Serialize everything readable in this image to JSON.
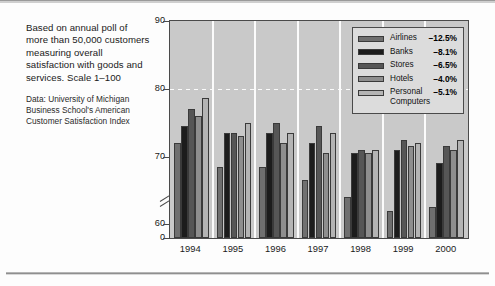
{
  "notes": {
    "lead": "Based on annual poll of more than 50,000 customers measuring overall satisfaction with goods and services. Scale 1–100",
    "source": "Data: University of Michigan Business School's American Customer Satisfaction Index"
  },
  "legend": {
    "entries": [
      {
        "label": "Airlines",
        "value": "–12.5%",
        "color": "#6f6f6f"
      },
      {
        "label": "Banks",
        "value": "–8.1%",
        "color": "#1c1c1c"
      },
      {
        "label": "Stores",
        "value": "–6.5%",
        "color": "#565656"
      },
      {
        "label": "Hotels",
        "value": "–4.0%",
        "color": "#8e8e8e"
      },
      {
        "label": "Personal Computers",
        "value": "–5.1%",
        "color": "#b4b4b4"
      }
    ]
  },
  "chart_data": {
    "type": "bar",
    "title": "",
    "xlabel": "",
    "ylabel": "",
    "ylim": [
      0,
      90
    ],
    "yticks": [
      0,
      60,
      70,
      80,
      90
    ],
    "ytick_labels": [
      "0",
      "60",
      "70",
      "80",
      "90"
    ],
    "axis_break": true,
    "axis_break_between": [
      0,
      60
    ],
    "grid": "dashed white horizontal line at 80; white vertical separators between year groups",
    "legend_position": "top-right inside plot",
    "categories": [
      "1994",
      "1995",
      "1996",
      "1997",
      "1998",
      "1999",
      "2000"
    ],
    "series": [
      {
        "name": "Airlines",
        "color": "#6f6f6f",
        "change": "-12.5%",
        "values": [
          72.0,
          68.5,
          68.5,
          66.5,
          64.0,
          62.0,
          62.5
        ]
      },
      {
        "name": "Banks",
        "color": "#1c1c1c",
        "change": "-8.1%",
        "values": [
          74.5,
          73.5,
          73.5,
          72.0,
          70.5,
          71.0,
          69.0
        ]
      },
      {
        "name": "Stores",
        "color": "#565656",
        "change": "-6.5%",
        "values": [
          77.0,
          73.5,
          75.0,
          74.5,
          71.0,
          72.5,
          71.5
        ]
      },
      {
        "name": "Hotels",
        "color": "#8e8e8e",
        "change": "-4.0%",
        "values": [
          76.0,
          73.0,
          72.0,
          70.5,
          70.5,
          71.5,
          71.0
        ]
      },
      {
        "name": "Personal Computers",
        "color": "#b4b4b4",
        "change": "-5.1%",
        "values": [
          78.7,
          75.0,
          73.5,
          73.5,
          71.0,
          72.0,
          72.5
        ]
      }
    ]
  }
}
